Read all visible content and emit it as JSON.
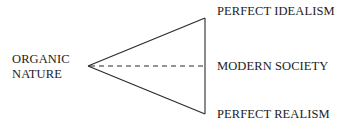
{
  "diagram": {
    "left_node": {
      "line1": "ORGANIC",
      "line2": "NATURE"
    },
    "right_nodes": {
      "top": "PERFECT IDEALISM",
      "middle": "MODERN SOCIETY",
      "bottom": "PERFECT REALISM"
    },
    "shape": {
      "type": "triangle",
      "apex": [
        88,
        66
      ],
      "top_vertex": [
        205,
        18
      ],
      "bottom_vertex": [
        205,
        114
      ],
      "midline": "dashed",
      "stroke_color": "#2a2a2a"
    }
  }
}
